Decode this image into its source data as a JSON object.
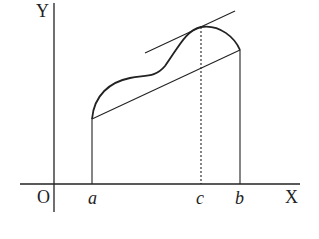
{
  "diagram": {
    "axes": {
      "x_label": "X",
      "y_label": "Y",
      "origin_label": "O"
    },
    "points": {
      "a_label": "a",
      "b_label": "b",
      "c_label": "c"
    },
    "colors": {
      "stroke": "#222222",
      "background": "#ffffff"
    }
  }
}
